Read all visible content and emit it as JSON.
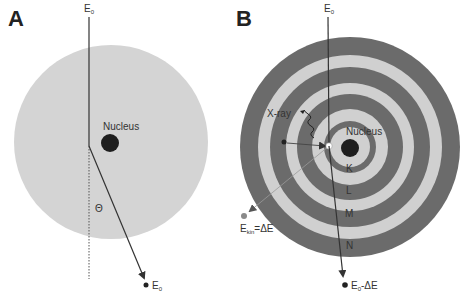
{
  "panels": [
    {
      "id": "A",
      "letter": "A",
      "incident_label": "E",
      "incident_sub": "0",
      "nucleus_label": "Nucleus",
      "angle_label": "Θ",
      "scattered_label": "E",
      "scattered_sub": "0",
      "colors": {
        "atom": "#d4d4d4",
        "nucleus": "#1e1e1e",
        "line": "#333333"
      }
    },
    {
      "id": "B",
      "letter": "B",
      "incident_label": "E",
      "incident_sub": "0",
      "nucleus_label": "Nucleus",
      "xray_label": "X-ray",
      "ejected_label": "E",
      "ejected_sub": "kin",
      "ejected_suffix": "=ΔE",
      "scattered_label": "E",
      "scattered_sub": "0",
      "scattered_suffix": "-ΔE",
      "shells": [
        "K",
        "L",
        "M",
        "N"
      ],
      "colors": {
        "dark_ring": "#6b6b6b",
        "light_ring": "#d0d0d0",
        "nucleus": "#1e1e1e",
        "line": "#333333"
      }
    }
  ]
}
